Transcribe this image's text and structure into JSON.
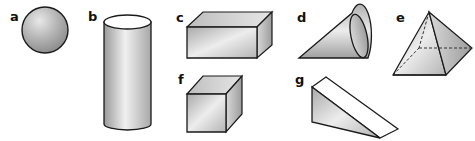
{
  "figure": {
    "shapes": [
      {
        "label": "a",
        "name": "sphere"
      },
      {
        "label": "b",
        "name": "cylinder"
      },
      {
        "label": "c",
        "name": "rectangular-prism"
      },
      {
        "label": "d",
        "name": "cone"
      },
      {
        "label": "e",
        "name": "square-pyramid"
      },
      {
        "label": "f",
        "name": "cube"
      },
      {
        "label": "g",
        "name": "triangular-prism"
      }
    ]
  },
  "colors": {
    "stroke": "#1a1a1a",
    "fill_light": "#f2f2f2",
    "fill_mid": "#c8c8c8",
    "fill_dark": "#9a9a9a"
  }
}
